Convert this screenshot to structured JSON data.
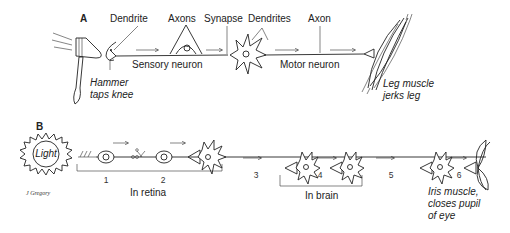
{
  "panel_a": {
    "label": "A",
    "labels": {
      "dendrite": "Dendrite",
      "axons": "Axons",
      "synapse": "Synapse",
      "dendrites": "Dendrites",
      "axon": "Axon",
      "sensory_neuron": "Sensory neuron",
      "motor_neuron": "Motor neuron",
      "hammer_line1": "Hammer",
      "hammer_line2": "taps knee",
      "muscle_line1": "Leg muscle",
      "muscle_line2": "jerks leg"
    }
  },
  "panel_b": {
    "label": "B",
    "light": "Light",
    "signature": "J Gregory",
    "steps": [
      "1",
      "2",
      "3",
      "4",
      "5",
      "6"
    ],
    "brackets": {
      "retina": "In retina",
      "brain": "In brain"
    },
    "iris_line1": "Iris muscle,",
    "iris_line2": "closes pupil",
    "iris_line3": "of eye"
  }
}
